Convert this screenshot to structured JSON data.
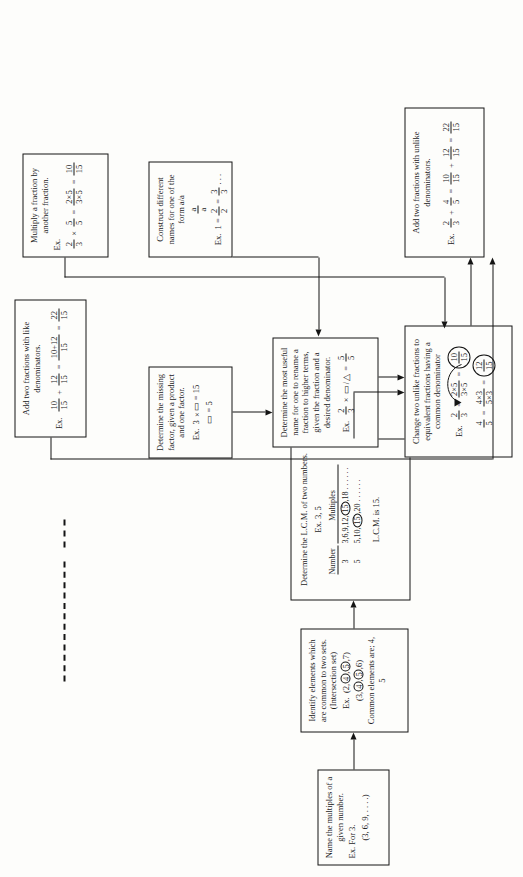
{
  "diagram": {
    "boxes": {
      "add_unlike": {
        "heading": "Add two fractions with unlike denominators.",
        "example": "Ex. 2/3 + 4/5 = 10/15 + 12/15 = 22/15"
      },
      "change_unlike": {
        "heading": "Change two unlike fractions to equivalent fractions having a common denominator",
        "example": "Ex. 2/3 = 2x5 / 3x5 = 10/15 ;  4/5 = 4x3 / 5x3 = 12/15"
      },
      "add_like": {
        "heading": "Add two fractions with like denominators.",
        "example": "Ex. 10/15 + 12/15 = 10+12 / 15 = 22/15"
      },
      "determine_name": {
        "heading": "Determine the most useful name for one to rename a fraction to higher terms, given the fraction and a desired denominator.",
        "example": "Ex. 2/3 x □/△ = 5/5"
      },
      "multiply": {
        "heading": "Multiply a fraction by another fraction.",
        "example": "Ex. 2/3 x 5/5 = 2x5 / 3x5 = 10/15"
      },
      "construct_names": {
        "heading": "Construct different names for one of the form a/a",
        "example": "Ex. 1 = 2/2 = 3/3 ..."
      },
      "missing_factor": {
        "heading": "Determine the missing factor, given a product and one factor.",
        "example": "Ex. 3 x □ = 15 ;  □ = 5"
      },
      "lcm": {
        "heading": "Determine the L.C.M. of two numbers.",
        "example": "Ex. 3, 5",
        "table_headers": [
          "Number",
          "Multiples"
        ],
        "table_rows": [
          [
            "3",
            "3,6,9,12,(15),18 . . . . . ."
          ],
          [
            "5",
            "5,10,(15),20 . . . . . ."
          ]
        ],
        "result": "L.C.M. is 15."
      },
      "intersection": {
        "heading": "Identify elements which are common to two sets. (Intersection set)",
        "example": "Ex. (2,4,5,7)  (3,4,5,6)",
        "result": "Common elements are; 4, 5"
      },
      "multiples": {
        "heading": "Name the multiples of a given number.",
        "example": "Ex. For 3.",
        "result": "(3, 6, 9, . . . .)"
      }
    }
  }
}
